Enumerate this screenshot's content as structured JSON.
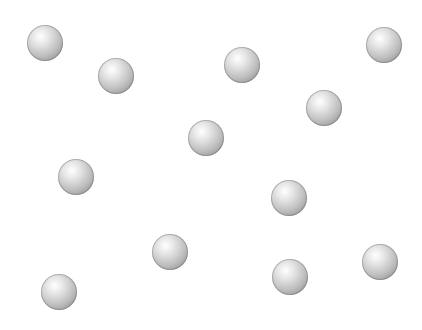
{
  "canvas": {
    "width": 422,
    "height": 330,
    "background": "#ffffff"
  },
  "sphere": {
    "radius": 18,
    "color": "#bdbdbd"
  },
  "spheres": [
    {
      "x": 45,
      "y": 43
    },
    {
      "x": 116,
      "y": 76
    },
    {
      "x": 242,
      "y": 65
    },
    {
      "x": 384,
      "y": 45
    },
    {
      "x": 324,
      "y": 108
    },
    {
      "x": 206,
      "y": 138
    },
    {
      "x": 76,
      "y": 177
    },
    {
      "x": 289,
      "y": 198
    },
    {
      "x": 170,
      "y": 252
    },
    {
      "x": 380,
      "y": 262
    },
    {
      "x": 290,
      "y": 277
    },
    {
      "x": 59,
      "y": 292
    }
  ]
}
